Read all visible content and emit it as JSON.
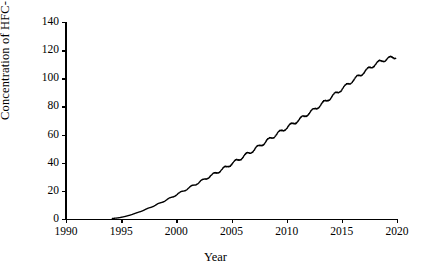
{
  "chart_data": {
    "type": "line",
    "title": "",
    "xlabel": "Year",
    "ylabel": "Concentration of HFC-134a (ppt)",
    "xlim": [
      1990,
      2020
    ],
    "ylim": [
      0,
      140
    ],
    "xticks": [
      1990,
      1995,
      2000,
      2005,
      2010,
      2015,
      2020
    ],
    "xtick_labels": [
      "1990",
      "1995",
      "2000",
      "2005",
      "2010",
      "2015",
      "2020"
    ],
    "yticks": [
      0,
      20,
      40,
      60,
      80,
      100,
      120,
      140
    ],
    "ytick_labels": [
      "0",
      "20",
      "40",
      "60",
      "80",
      "100",
      "120",
      "140"
    ],
    "grid": false,
    "legend": null,
    "line_color": "#000000",
    "background_color": "#ffffff",
    "series": [
      {
        "name": "HFC-134a",
        "color": "#000000",
        "x": [
          1994.2,
          1994.5,
          1994.8,
          1995.0,
          1995.3,
          1995.6,
          1995.9,
          1996.2,
          1996.5,
          1996.8,
          1997.1,
          1997.4,
          1997.7,
          1998.0,
          1998.3,
          1998.6,
          1998.9,
          1999.2,
          1999.5,
          1999.8,
          2000.1,
          2000.4,
          2000.7,
          2001.0,
          2001.3,
          2001.6,
          2001.9,
          2002.2,
          2002.5,
          2002.8,
          2003.1,
          2003.4,
          2003.7,
          2004.0,
          2004.3,
          2004.6,
          2004.9,
          2005.2,
          2005.5,
          2005.8,
          2006.1,
          2006.4,
          2006.7,
          2007.0,
          2007.3,
          2007.6,
          2007.9,
          2008.2,
          2008.5,
          2008.8,
          2009.1,
          2009.4,
          2009.7,
          2010.0,
          2010.3,
          2010.6,
          2010.9,
          2011.2,
          2011.5,
          2011.8,
          2012.1,
          2012.4,
          2012.7,
          2013.0,
          2013.3,
          2013.6,
          2013.9,
          2014.2,
          2014.5,
          2014.8,
          2015.1,
          2015.4,
          2015.7,
          2016.0,
          2016.3,
          2016.6,
          2016.9,
          2017.2,
          2017.5,
          2017.8,
          2018.1,
          2018.4,
          2018.7,
          2019.0,
          2019.3,
          2019.6,
          2019.9
        ],
        "y": [
          0.4,
          0.6,
          0.9,
          1.2,
          1.7,
          2.3,
          3.0,
          3.8,
          4.6,
          5.5,
          6.4,
          7.4,
          8.4,
          9.4,
          10.5,
          11.6,
          12.7,
          13.9,
          15.1,
          16.3,
          17.6,
          18.9,
          20.2,
          21.5,
          22.8,
          24.1,
          25.4,
          26.7,
          28.0,
          29.3,
          30.6,
          31.9,
          33.2,
          34.5,
          35.9,
          37.3,
          38.7,
          40.1,
          41.5,
          43.0,
          44.5,
          46.0,
          47.5,
          49.0,
          50.6,
          52.2,
          53.8,
          55.4,
          57.0,
          58.7,
          60.3,
          61.9,
          63.4,
          64.9,
          66.4,
          67.9,
          69.4,
          70.9,
          72.5,
          74.1,
          75.7,
          77.3,
          79.0,
          80.7,
          82.4,
          84.1,
          85.8,
          87.6,
          89.4,
          91.2,
          93.0,
          94.8,
          96.6,
          98.4,
          100.2,
          102.0,
          103.8,
          105.5,
          107.2,
          108.8,
          110.3,
          111.6,
          112.7,
          113.5,
          114.2,
          114.8,
          115.2
        ],
        "start_value": 0.4,
        "end_value": 115.2,
        "seasonal_amplitude_ppt": 1.1
      }
    ]
  }
}
